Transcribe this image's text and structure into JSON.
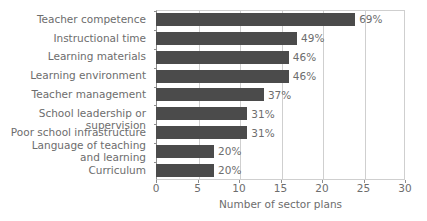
{
  "chart_data": {
    "type": "bar",
    "orientation": "horizontal",
    "title": "",
    "xlabel": "Number of sector plans",
    "ylabel": "",
    "xlim": [
      0,
      30
    ],
    "xticks": [
      0,
      5,
      10,
      15,
      20,
      25,
      30
    ],
    "grid": true,
    "legend": null,
    "bar_color": "#4b4b4b",
    "text_color": "#6d6d6d",
    "categories": [
      "Teacher competence",
      "Instructional time",
      "Learning materials",
      "Learning environment",
      "Teacher management",
      "School leadership or supervision",
      "Poor school infrastructure",
      "Language of teaching\nand learning",
      "Curriculum"
    ],
    "values": [
      24,
      17,
      16,
      16,
      13,
      11,
      11,
      7,
      7
    ],
    "data_labels": [
      "69%",
      "49%",
      "46%",
      "46%",
      "37%",
      "31%",
      "31%",
      "20%",
      "20%"
    ]
  }
}
